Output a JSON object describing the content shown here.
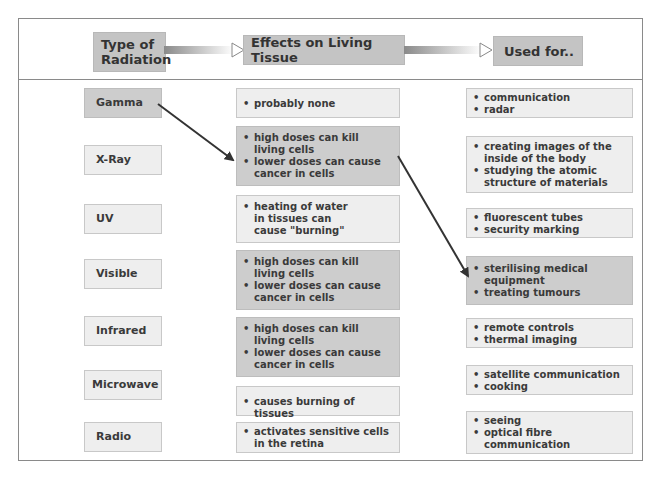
{
  "header": {
    "col1": "Type of Radiation",
    "col1_line1": "Type of",
    "col1_line2": "Radiation",
    "col2": "Effects on Living Tissue",
    "col3": "Used for.."
  },
  "radiation_types": [
    {
      "label": "Gamma",
      "highlight": true
    },
    {
      "label": "X-Ray",
      "highlight": false
    },
    {
      "label": "UV",
      "highlight": false
    },
    {
      "label": "Visible",
      "highlight": false
    },
    {
      "label": "Infrared",
      "highlight": false
    },
    {
      "label": "Microwave",
      "highlight": false
    },
    {
      "label": "Radio",
      "highlight": false
    }
  ],
  "effects": [
    {
      "items": [
        "probably none"
      ],
      "highlight": false
    },
    {
      "items": [
        "high doses can kill living cells",
        "lower doses can cause cancer in cells"
      ],
      "highlight": true
    },
    {
      "items": [
        "heating of water in tissues can cause \"burning\""
      ],
      "highlight": false
    },
    {
      "items": [
        "high doses can kill living cells",
        "lower doses can cause cancer in cells"
      ],
      "highlight": true
    },
    {
      "items": [
        "high doses can kill living cells",
        "lower doses can cause cancer in cells"
      ],
      "highlight": true
    },
    {
      "items": [
        "causes burning of tissues"
      ],
      "highlight": false
    },
    {
      "items": [
        "activates sensitive cells in the retina"
      ],
      "highlight": false
    }
  ],
  "uses": [
    {
      "items": [
        "communication",
        "radar"
      ],
      "highlight": false
    },
    {
      "items": [
        "creating images of the inside of the body",
        "studying the atomic structure of materials"
      ],
      "highlight": false
    },
    {
      "items": [
        "fluorescent tubes",
        "security marking"
      ],
      "highlight": false
    },
    {
      "items": [
        "sterilising medical equipment",
        "treating tumours"
      ],
      "highlight": true
    },
    {
      "items": [
        "remote controls",
        "thermal imaging"
      ],
      "highlight": false
    },
    {
      "items": [
        "satellite communication",
        "cooking"
      ],
      "highlight": false
    },
    {
      "items": [
        "seeing",
        "optical fibre communication"
      ],
      "highlight": false
    }
  ],
  "connectors": [
    {
      "from": "Gamma",
      "to": "effects[1]"
    },
    {
      "from": "effects[1]",
      "to": "uses[3]"
    }
  ],
  "colors": {
    "highlight_box": "#cdcdcd",
    "plain_box": "#eeeeee",
    "header_box": "#c4c4c4",
    "border": "#8a8a8a",
    "arrow": "#333333"
  }
}
